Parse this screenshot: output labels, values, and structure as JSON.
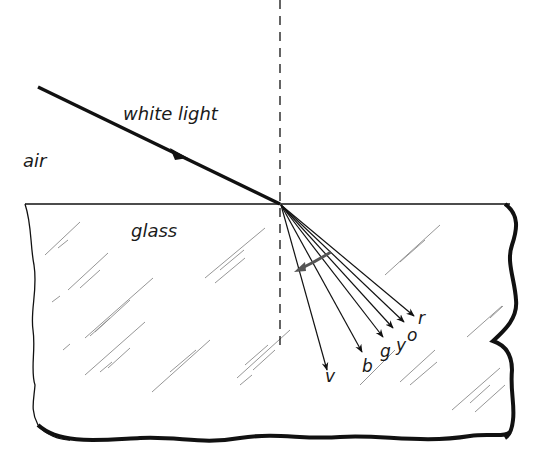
{
  "figure": {
    "media": {
      "upper": "air",
      "lower": "glass"
    },
    "incident_ray_label": "white light",
    "spectrum_labels": [
      "v",
      "b",
      "g",
      "y",
      "o",
      "r"
    ],
    "colors": {
      "ink": "#111111",
      "hatch": "#8a8a8a",
      "background": "#ffffff"
    }
  }
}
